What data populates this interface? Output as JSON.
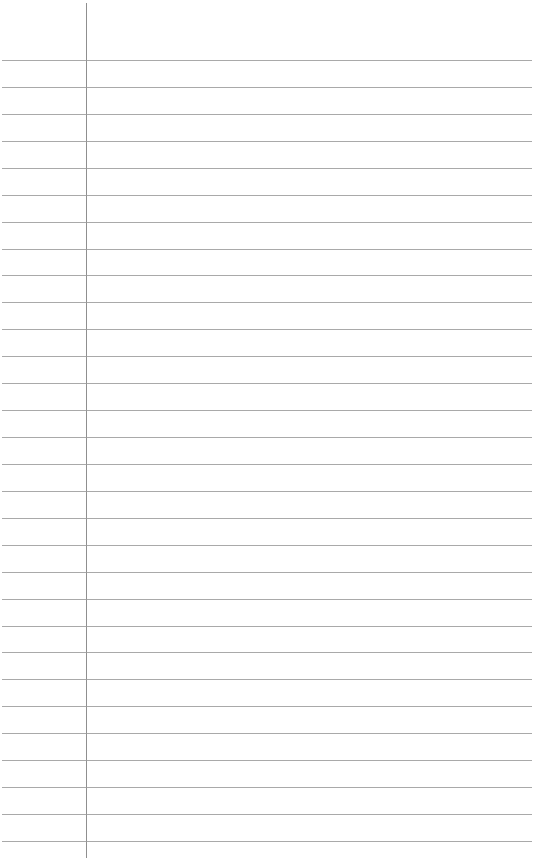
{
  "page": {
    "type": "lined-paper",
    "background_color": "#ffffff",
    "line_color": "#9a9a9a",
    "margin_line_color": "#8f8f8f",
    "line_count": 30,
    "first_line_y": 60,
    "line_spacing": 26.93,
    "margin_x": 86,
    "text": ""
  }
}
